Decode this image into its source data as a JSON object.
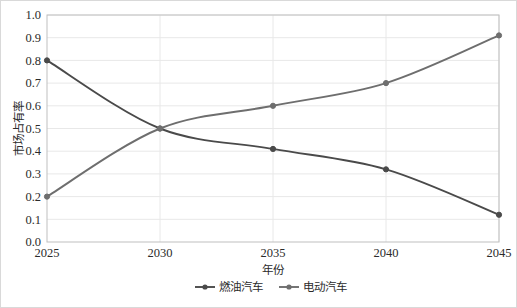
{
  "chart_data": {
    "type": "line",
    "title": "",
    "xlabel": "年份",
    "ylabel": "市场占有率",
    "x": [
      2025,
      2030,
      2035,
      2040,
      2045
    ],
    "categories": [
      "2025",
      "2030",
      "2035",
      "2040",
      "2045"
    ],
    "series": [
      {
        "name": "燃油汽车",
        "values": [
          0.8,
          0.5,
          0.41,
          0.32,
          0.12
        ],
        "color": "#4a4a4a"
      },
      {
        "name": "电动汽车",
        "values": [
          0.2,
          0.5,
          0.6,
          0.7,
          0.91
        ],
        "color": "#6e6e6e"
      }
    ],
    "ylim": [
      0.0,
      1.0
    ],
    "xlim": [
      2025,
      2045
    ],
    "ytick_labels": [
      "0.0",
      "0.1",
      "0.2",
      "0.3",
      "0.4",
      "0.5",
      "0.6",
      "0.7",
      "0.8",
      "0.9",
      "1.0"
    ],
    "ytick_values": [
      0.0,
      0.1,
      0.2,
      0.3,
      0.4,
      0.5,
      0.6,
      0.7,
      0.8,
      0.9,
      1.0
    ],
    "xtick_labels": [
      "2025",
      "2030",
      "2035",
      "2040",
      "2045"
    ],
    "grid": {
      "horizontal": true,
      "vertical": true,
      "color": "#e8e8e8"
    },
    "legend": {
      "position": "bottom",
      "entries": [
        "燃油汽车",
        "电动汽车"
      ]
    },
    "marker": "circle",
    "plot_border_color": "#bfbfbf",
    "frame_border_color": "#d9d9d9",
    "background_color": "#ffffff"
  },
  "axis": {
    "y_title": "市场占有率",
    "x_title": "年份",
    "y_ticks": [
      "1.0",
      "0.9",
      "0.8",
      "0.7",
      "0.6",
      "0.5",
      "0.4",
      "0.3",
      "0.2",
      "0.1",
      "0.0"
    ],
    "x_ticks": [
      "2025",
      "2030",
      "2035",
      "2040",
      "2045"
    ]
  },
  "legend": {
    "series_one": "燃油汽车",
    "series_two": "电动汽车"
  }
}
